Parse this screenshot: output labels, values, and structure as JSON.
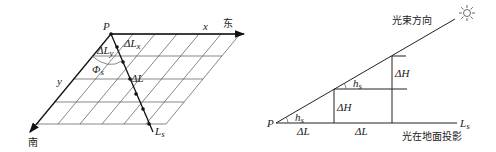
{
  "left_diagram": {
    "origin_label": "P",
    "x_axis_label": "x",
    "east_label": "东",
    "south_label": "南",
    "y_axis_label": "y",
    "line_label": "L",
    "line_label_sub": "s",
    "delta_lx_label": "ΔL",
    "delta_lx_sub": "x",
    "delta_ly_label": "ΔL",
    "delta_ly_sub": "y",
    "angle_label": "Φ",
    "angle_sub": "s",
    "delta_l_label": "ΔL"
  },
  "right_diagram": {
    "origin_label": "P",
    "beam_direction_label": "光束方向",
    "ground_projection_label": "光在地面投影",
    "line_label": "L",
    "line_label_sub": "s",
    "angle_label": "h",
    "angle_sub": "s",
    "delta_h_label": "ΔH",
    "delta_l_label": "ΔL",
    "sun_icon": "sun-icon"
  }
}
